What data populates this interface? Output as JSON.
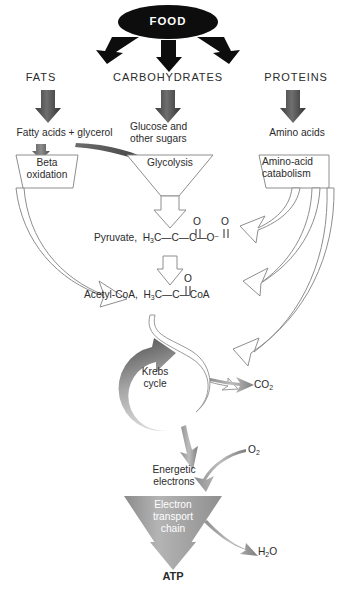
{
  "figure": {
    "type": "diagram"
  },
  "nodes": {
    "food": "FOOD",
    "fats": "FATS",
    "carbohydrates": "CARBOHYDRATES",
    "proteins": "PROTEINS",
    "fatty_acids": "Fatty acids + glycerol",
    "glucose_line1": "Glucose and",
    "glucose_line2": "other sugars",
    "amino_acids": "Amino acids",
    "beta_oxidation_line1": "Beta",
    "beta_oxidation_line2": "oxidation",
    "glycolysis": "Glycolysis",
    "amino_catabolism_line1": "Amino-acid",
    "amino_catabolism_line2": "catabolism",
    "pyruvate_label": "Pyruvate,",
    "acetyl_coa_label": "Acetyl-CoA,",
    "krebs_line1": "Krebs",
    "krebs_line2": "cycle",
    "co2": "CO2",
    "o2": "O2",
    "h2o": "H2O",
    "energetic_line1": "Energetic",
    "energetic_line2": "electrons",
    "etc_line1": "Electron",
    "etc_line2": "transport",
    "etc_line3": "chain",
    "atp": "ATP"
  },
  "formulas": {
    "pyruvate": {
      "prefix": "H",
      "prefix_sub": "3",
      "c1": "C",
      "bond1": "—",
      "c2": "C",
      "bond2": "—",
      "c3": "C",
      "bond3": "—",
      "oxygen": "O",
      "charge": "–",
      "carbonyl_o": "O",
      "double_bond": "‖"
    },
    "acetyl_coa": {
      "prefix": "H",
      "prefix_sub": "3",
      "c1": "C",
      "bond1": "—",
      "c2": "C",
      "bond2": "—",
      "coa": "CoA",
      "carbonyl_o": "O",
      "double_bond": "‖"
    }
  },
  "colors": {
    "black": "#0d0d0d",
    "dark_gray_arrow": "#4a4a4a",
    "mid_gray": "#8a8a8a",
    "light_gray": "#b8b8b8",
    "outline": "#8e8e8e",
    "text": "#2b2b2b",
    "white": "#ffffff"
  },
  "flow": {
    "type": "diagram",
    "edges": [
      {
        "from": "FOOD",
        "to": "FATS",
        "style": "black-arrow"
      },
      {
        "from": "FOOD",
        "to": "CARBOHYDRATES",
        "style": "black-arrow"
      },
      {
        "from": "FOOD",
        "to": "PROTEINS",
        "style": "black-arrow"
      },
      {
        "from": "FATS",
        "to": "Fatty acids + glycerol",
        "style": "gray-arrow"
      },
      {
        "from": "CARBOHYDRATES",
        "to": "Glucose and other sugars",
        "style": "gray-arrow"
      },
      {
        "from": "PROTEINS",
        "to": "Amino acids",
        "style": "gray-arrow"
      },
      {
        "from": "Fatty acids + glycerol",
        "to": "Beta oxidation",
        "style": "small-gray-arrow"
      },
      {
        "from": "glycerol",
        "to": "Glycolysis",
        "style": "dark-curved-arrow"
      },
      {
        "from": "Glucose and other sugars",
        "to": "Glycolysis",
        "style": "funnel"
      },
      {
        "from": "Amino acids",
        "to": "Amino-acid catabolism",
        "style": "funnel"
      },
      {
        "from": "Glycolysis",
        "to": "Pyruvate",
        "style": "white-arrow"
      },
      {
        "from": "Beta oxidation",
        "to": "Acetyl-CoA",
        "style": "white-curved-arrow"
      },
      {
        "from": "Amino-acid catabolism",
        "to": "Pyruvate",
        "style": "white-curved-arrow"
      },
      {
        "from": "Amino-acid catabolism",
        "to": "Acetyl-CoA",
        "style": "white-curved-arrow"
      },
      {
        "from": "Amino-acid catabolism",
        "to": "Krebs cycle",
        "style": "white-curved-arrow"
      },
      {
        "from": "Pyruvate",
        "to": "Acetyl-CoA",
        "style": "white-arrow"
      },
      {
        "from": "Acetyl-CoA",
        "to": "Krebs cycle",
        "style": "white-ribbon"
      },
      {
        "from": "Krebs cycle",
        "to": "CO2",
        "style": "gray-arrow"
      },
      {
        "from": "Krebs cycle",
        "to": "Energetic electrons",
        "style": "gray-arrow"
      },
      {
        "from": "O2",
        "to": "Electron transport chain",
        "style": "gray-curved-arrow"
      },
      {
        "from": "Energetic electrons",
        "to": "Electron transport chain",
        "style": "funnel"
      },
      {
        "from": "Electron transport chain",
        "to": "ATP",
        "style": "gray-arrow"
      },
      {
        "from": "Electron transport chain",
        "to": "H2O",
        "style": "gray-curved-arrow"
      }
    ]
  }
}
